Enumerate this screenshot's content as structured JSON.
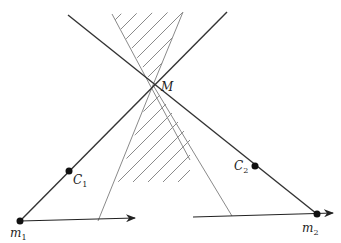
{
  "figure": {
    "points": {
      "M": {
        "label": "M",
        "sub": ""
      },
      "m1": {
        "label": "m",
        "sub": "1"
      },
      "m2": {
        "label": "m",
        "sub": "2"
      },
      "C1": {
        "label": "C",
        "sub": "1"
      },
      "C2": {
        "label": "C",
        "sub": "2"
      }
    },
    "colors": {
      "dark_line": "#333333",
      "gray_line": "#8a8a8a",
      "hatch": "#8a8a8a",
      "point": "#111111"
    }
  }
}
